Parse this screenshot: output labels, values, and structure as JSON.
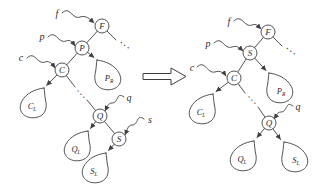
{
  "figure": {
    "left_tree": {
      "pointers": {
        "f": "f",
        "p": "p",
        "c": "c",
        "q": "q",
        "s": "s"
      },
      "nodes": {
        "F": "F",
        "P": "P",
        "C": "C",
        "Q": "Q",
        "S": "S"
      },
      "subtrees": {
        "PR": {
          "base": "P",
          "sub": "R"
        },
        "CL": {
          "base": "C",
          "sub": "L"
        },
        "QL": {
          "base": "Q",
          "sub": "L"
        },
        "SL": {
          "base": "S",
          "sub": "L"
        }
      },
      "ellipsis_top": "...",
      "ellipsis_mid": "..."
    },
    "right_tree": {
      "pointers": {
        "f": "f",
        "p": "p",
        "c": "c",
        "q": "q"
      },
      "nodes": {
        "F": "F",
        "S": "S",
        "C": "C",
        "Q": "Q"
      },
      "subtrees": {
        "PR": {
          "base": "P",
          "sub": "R"
        },
        "CL": {
          "base": "C",
          "sub": "L"
        },
        "QL": {
          "base": "Q",
          "sub": "L"
        },
        "SL": {
          "base": "S",
          "sub": "L"
        }
      },
      "ellipsis_top": "...",
      "ellipsis_mid": "..."
    },
    "transform_arrow_icon": "double-arrow-right-icon",
    "colors": {
      "ink": "#3f3f3f",
      "background": "#ffffff"
    }
  }
}
